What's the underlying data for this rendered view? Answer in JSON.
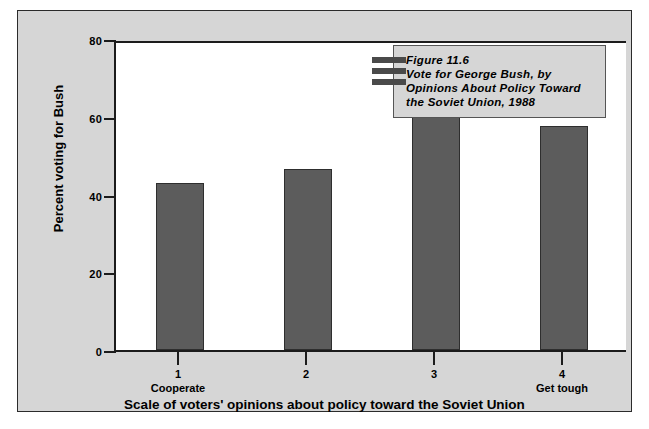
{
  "chart_data": {
    "type": "bar",
    "title": "Figure 11.6 Vote for George Bush, by Opinions About Policy Toward the Soviet Union, 1988",
    "title_lines": [
      "Figure 11.6",
      "Vote for George Bush, by",
      "Opinions About Policy Toward",
      "the Soviet Union, 1988"
    ],
    "categories": [
      "1",
      "2",
      "3",
      "4"
    ],
    "category_sublabels": [
      "Cooperate",
      "",
      "",
      "Get tough"
    ],
    "values": [
      43,
      46.5,
      60.5,
      57.5
    ],
    "xlabel": "Scale of voters' opinions about policy toward the Soviet Union",
    "ylabel": "Percent voting for Bush",
    "ylim": [
      0,
      80
    ],
    "yticks": [
      0,
      20,
      40,
      60,
      80
    ],
    "ytick_labels": [
      "0",
      "20",
      "40",
      "60",
      "80"
    ],
    "grid": false,
    "legend": "none",
    "bar_color": "#5c5c5c",
    "background_color": "#d6d6d6",
    "plot_background_color": "#ffffff"
  }
}
